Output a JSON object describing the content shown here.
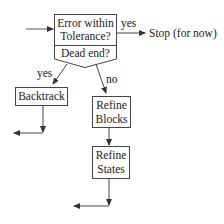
{
  "diagram": {
    "decision": {
      "question_line1": "Error within",
      "question_line2": "Tolerance?",
      "secondary": "Dead end?"
    },
    "edges": {
      "yes_stop": "yes",
      "yes_backtrack": "yes",
      "no_refine": "no"
    },
    "terminal": {
      "label": "Stop (for now)"
    },
    "nodes": {
      "backtrack": {
        "label": "Backtrack"
      },
      "refine_blocks": {
        "line1": "Refine",
        "line2": "Blocks"
      },
      "refine_states": {
        "line1": "Refine",
        "line2": "States"
      }
    },
    "colors": {
      "stroke": "#333333",
      "text": "#222222",
      "background": "#ffffff"
    }
  }
}
